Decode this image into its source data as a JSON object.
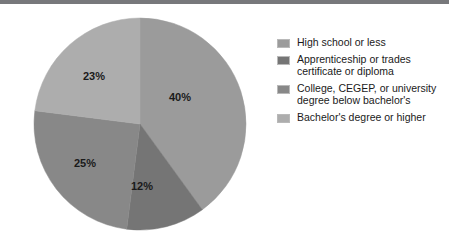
{
  "page": {
    "background_color": "#ffffff",
    "top_rule_color": "#77787b"
  },
  "chart_data": {
    "type": "pie",
    "title": "",
    "subtitle": "",
    "xlabel": "",
    "ylabel": "",
    "grid": false,
    "legend_position": "right",
    "start_angle_deg": 0,
    "direction": "clockwise",
    "categories": [
      "High school or less",
      "Apprenticeship or trades certificate or diploma",
      "College, CEGEP, or university degree below bachelor's",
      "Bachelor's degree or higher"
    ],
    "values": [
      40,
      12,
      25,
      23
    ],
    "value_labels": [
      "40%",
      "12%",
      "25%",
      "23%"
    ],
    "colors": [
      "#9b9b9b",
      "#757575",
      "#888888",
      "#adadad"
    ],
    "units": "percent",
    "total": 100
  },
  "pie": {
    "center_x": 108,
    "center_y": 108,
    "radius": 106,
    "slices": [
      {
        "name": "high-school-or-less",
        "label": "40%",
        "value": 40,
        "color": "#9b9b9b",
        "label_x": 148,
        "label_y": 82
      },
      {
        "name": "apprenticeship-or-trades",
        "label": "12%",
        "value": 12,
        "color": "#757575",
        "label_x": 110,
        "label_y": 171
      },
      {
        "name": "college-cegep-or-university-below-bachelors",
        "label": "25%",
        "value": 25,
        "color": "#888888",
        "label_x": 53,
        "label_y": 148
      },
      {
        "name": "bachelors-degree-or-higher",
        "label": "23%",
        "value": 23,
        "color": "#adadad",
        "label_x": 62,
        "label_y": 61
      }
    ]
  },
  "legend": {
    "items": [
      {
        "label": "High school or less",
        "color": "#9b9b9b",
        "value": "40%"
      },
      {
        "label": "Apprenticeship or trades\ncertificate or diploma",
        "color": "#757575",
        "value": "12%"
      },
      {
        "label": "College, CEGEP, or university\ndegree below bachelor's",
        "color": "#888888",
        "value": "25%"
      },
      {
        "label": "Bachelor's degree or higher",
        "color": "#adadad",
        "value": "23%"
      }
    ]
  }
}
